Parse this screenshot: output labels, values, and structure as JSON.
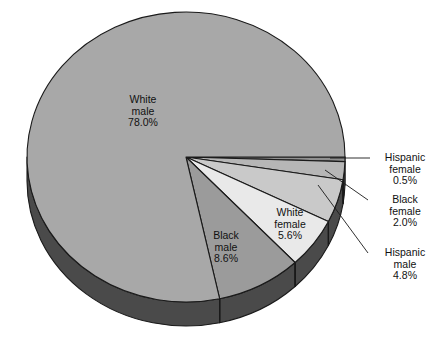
{
  "chart_data": {
    "type": "pie",
    "title": "",
    "subtitle": "",
    "xlabel": "",
    "ylabel": "",
    "legend_position": "none",
    "grid": false,
    "three_d": true,
    "categories": [
      "White male",
      "Black male",
      "White female",
      "Hispanic male",
      "Black female",
      "Hispanic female"
    ],
    "values": [
      78.0,
      8.6,
      5.6,
      4.8,
      2.0,
      0.5
    ],
    "value_suffix": "%",
    "slices": [
      {
        "name": "White male",
        "value": 78.0,
        "value_text": "78.0%",
        "label_line1": "White",
        "label_line2": "male",
        "color": "#a8a8a8",
        "label_placement": "inside"
      },
      {
        "name": "Black male",
        "value": 8.6,
        "value_text": "8.6%",
        "label_line1": "Black",
        "label_line2": "male",
        "color": "#9b9b9b",
        "label_placement": "inside"
      },
      {
        "name": "White female",
        "value": 5.6,
        "value_text": "5.6%",
        "label_line1": "White",
        "label_line2": "female",
        "color": "#e9e9e9",
        "label_placement": "inside"
      },
      {
        "name": "Hispanic male",
        "value": 4.8,
        "value_text": "4.8%",
        "label_line1": "Hispanic",
        "label_line2": "male",
        "color": "#c9c9c9",
        "label_placement": "callout"
      },
      {
        "name": "Black female",
        "value": 2.0,
        "value_text": "2.0%",
        "label_line1": "Black",
        "label_line2": "female",
        "color": "#b6b6b6",
        "label_placement": "callout"
      },
      {
        "name": "Hispanic female",
        "value": 0.5,
        "value_text": "0.5%",
        "label_line1": "Hispanic",
        "label_line2": "female",
        "color": "#8f8f8f",
        "label_placement": "callout"
      }
    ],
    "colors": {
      "white_male": "#a8a8a8",
      "black_male": "#9b9b9b",
      "white_female": "#e9e9e9",
      "hispanic_male": "#c9c9c9",
      "black_female": "#b6b6b6",
      "hispanic_female": "#8f8f8f",
      "side_wall": "#4a4a4a",
      "side_wall_light": "#5a5a5a",
      "outline": "#1a1a1a",
      "background": "#ffffff",
      "text": "#111111"
    }
  },
  "labels": {
    "white_male": {
      "l1": "White",
      "l2": "male",
      "l3": "78.0%"
    },
    "black_male": {
      "l1": "Black",
      "l2": "male",
      "l3": "8.6%"
    },
    "white_female": {
      "l1": "White",
      "l2": "female",
      "l3": "5.6%"
    },
    "hispanic_female": {
      "l1": "Hispanic",
      "l2": "female",
      "l3": "0.5%"
    },
    "black_female": {
      "l1": "Black",
      "l2": "female",
      "l3": "2.0%"
    },
    "hispanic_male": {
      "l1": "Hispanic",
      "l2": "male",
      "l3": "4.8%"
    }
  }
}
